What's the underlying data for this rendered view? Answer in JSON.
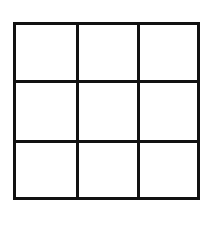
{
  "grid": {
    "rows": 3,
    "columns": 3,
    "line_color": "#111111",
    "background_color": "#ffffff",
    "cells": [
      [
        "",
        "",
        ""
      ],
      [
        "",
        "",
        ""
      ],
      [
        "",
        "",
        ""
      ]
    ]
  }
}
